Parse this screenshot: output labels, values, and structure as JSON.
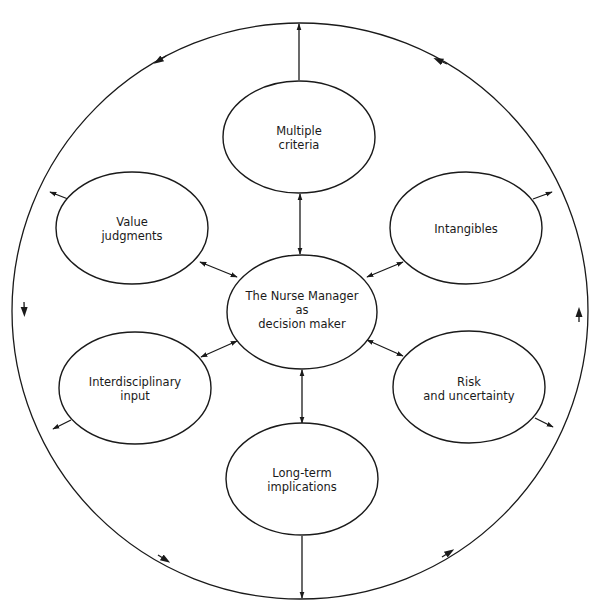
{
  "diagram": {
    "type": "hub-and-spoke concept diagram",
    "colors": {
      "stroke": "#1a1a1a",
      "background": "#ffffff"
    },
    "outer_cycle": {
      "shape": "circle",
      "direction": "counterclockwise",
      "arrow_count": 8
    },
    "center": {
      "id": "nurse-manager",
      "lines": [
        "The Nurse Manager",
        "as",
        "decision maker"
      ]
    },
    "nodes": [
      {
        "id": "multiple-criteria",
        "lines": [
          "Multiple",
          "criteria"
        ],
        "link_to_center": "bidirectional",
        "link_to_outer": "outward"
      },
      {
        "id": "intangibles",
        "lines": [
          "Intangibles"
        ],
        "link_to_center": "bidirectional",
        "link_to_outer": "outward"
      },
      {
        "id": "risk-uncertainty",
        "lines": [
          "Risk",
          "and uncertainty"
        ],
        "link_to_center": "bidirectional",
        "link_to_outer": "outward"
      },
      {
        "id": "long-term-implications",
        "lines": [
          "Long-term",
          "implications"
        ],
        "link_to_center": "bidirectional",
        "link_to_outer": "outward"
      },
      {
        "id": "interdisciplinary-input",
        "lines": [
          "Interdisciplinary",
          "input"
        ],
        "link_to_center": "bidirectional",
        "link_to_outer": "outward"
      },
      {
        "id": "value-judgments",
        "lines": [
          "Value",
          "judgments"
        ],
        "link_to_center": "bidirectional",
        "link_to_outer": "outward"
      }
    ]
  }
}
